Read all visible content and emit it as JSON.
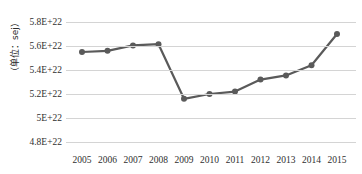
{
  "chart_data": {
    "type": "line",
    "title": "",
    "xlabel": "",
    "ylabel": "（单位：sej）",
    "categories": [
      "2005",
      "2006",
      "2007",
      "2008",
      "2009",
      "2010",
      "2011",
      "2012",
      "2013",
      "2014",
      "2015"
    ],
    "values": [
      5.55e+22,
      5.56e+22,
      5.605e+22,
      5.615e+22,
      5.16e+22,
      5.2e+22,
      5.22e+22,
      5.32e+22,
      5.355e+22,
      5.44e+22,
      5.7e+22
    ],
    "series": [
      {
        "name": "能值",
        "values": [
          5.55e+22,
          5.56e+22,
          5.605e+22,
          5.615e+22,
          5.16e+22,
          5.2e+22,
          5.22e+22,
          5.32e+22,
          5.355e+22,
          5.44e+22,
          5.7e+22
        ]
      }
    ],
    "ylim": [
      4.8e+22,
      5.8e+22
    ],
    "yticks": [
      5.8e+22,
      5.6e+22,
      5.4e+22,
      5.2e+22,
      5e+22,
      4.8e+22
    ],
    "ytick_labels": [
      "5.8E+22",
      "5.6E+22",
      "5.4E+22",
      "5.2E+22",
      "5E+22",
      "4.8E+22"
    ],
    "xtick_labels": [
      "2005",
      "2006",
      "2007",
      "2008",
      "2009",
      "2010",
      "2011",
      "2012",
      "2013",
      "2014",
      "2015"
    ],
    "grid": true,
    "grid_axis": "y",
    "legend": false,
    "legend_position": "none",
    "line_color": "#5a5a5a",
    "marker_color": "#5a5a5a",
    "marker": "circle",
    "gridline_color": "#d4d4d4",
    "background_color": "#ffffff",
    "text_color": "#2f2f2f"
  }
}
